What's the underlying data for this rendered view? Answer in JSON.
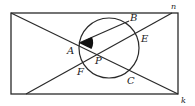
{
  "diagram": {
    "type": "geometry",
    "colors": {
      "stroke": "#2a2a2a",
      "fill_wedge": "#111111",
      "background": "#ffffff"
    },
    "labels": {
      "A": "A",
      "B": "B",
      "C": "C",
      "E": "E",
      "F": "F",
      "P": "P",
      "n": "n",
      "k": "k"
    },
    "shapes": {
      "rectangle": {
        "x": 11,
        "y": 13,
        "width": 167,
        "height": 81
      },
      "circle": {
        "cx": 109,
        "cy": 48,
        "r": 30
      },
      "line_APC": {
        "x1": 11,
        "y1": 13,
        "x2": 178,
        "y2": 94
      },
      "line_FPE": {
        "x1": 26,
        "y1": 94,
        "x2": 172,
        "y2": 13
      },
      "chord_AB": {
        "x1": 79,
        "y1": 43,
        "x2": 129,
        "y2": 21
      }
    }
  }
}
